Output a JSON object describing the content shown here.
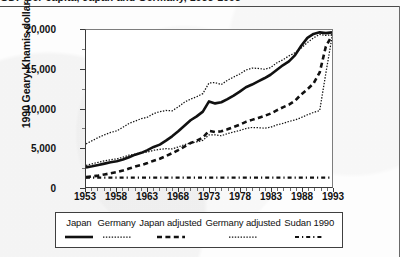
{
  "page": {
    "clipped_top_text": "GDP per capita, Japan and Germany, 1953-1993",
    "background_color": "#fdfdfd",
    "ink_color": "#111111"
  },
  "chart_data": {
    "type": "line",
    "title": "",
    "xlabel": "",
    "ylabel": "1990 Geary-Khamis dollars",
    "xlim": [
      1953,
      1993
    ],
    "ylim": [
      0,
      20000
    ],
    "ytick_values": [
      0,
      5000,
      10000,
      15000,
      20000
    ],
    "ytick_labels": [
      "0",
      "5,000",
      "10,000",
      "15,000",
      "20,000"
    ],
    "xtick_values": [
      1953,
      1958,
      1963,
      1968,
      1973,
      1978,
      1983,
      1988,
      1993
    ],
    "xtick_labels": [
      "1953",
      "1958",
      "1963",
      "1968",
      "1973",
      "1978",
      "1983",
      "1988",
      "1993"
    ],
    "minor_xticks_every": 1,
    "grid": false,
    "legend_position": "below-plot-boxed",
    "x": [
      1953,
      1954,
      1955,
      1956,
      1957,
      1958,
      1959,
      1960,
      1961,
      1962,
      1963,
      1964,
      1965,
      1966,
      1967,
      1968,
      1969,
      1970,
      1971,
      1972,
      1973,
      1974,
      1975,
      1976,
      1977,
      1978,
      1979,
      1980,
      1981,
      1982,
      1983,
      1984,
      1985,
      1986,
      1987,
      1988,
      1989,
      1990,
      1991,
      1992,
      1993
    ],
    "series": [
      {
        "name": "Japan",
        "style": "solid-thick",
        "color": "#111111",
        "values": [
          2500,
          2640,
          2800,
          2980,
          3150,
          3280,
          3500,
          3800,
          4120,
          4350,
          4700,
          5100,
          5400,
          5900,
          6450,
          7100,
          7800,
          8500,
          9000,
          9600,
          10900,
          10650,
          10800,
          11200,
          11650,
          12150,
          12700,
          13050,
          13450,
          13850,
          14300,
          14900,
          15500,
          16000,
          16800,
          18000,
          19000,
          19500,
          19700,
          19600,
          19700
        ]
      },
      {
        "name": "Germany",
        "style": "dotted-fine",
        "color": "#111111",
        "values": [
          5500,
          5900,
          6300,
          6650,
          6950,
          7150,
          7600,
          8100,
          8400,
          8700,
          8900,
          9350,
          9600,
          9750,
          9700,
          10200,
          10800,
          11200,
          11500,
          11900,
          13250,
          13300,
          13050,
          13600,
          14000,
          14400,
          14900,
          15150,
          15100,
          15000,
          15200,
          15800,
          16200,
          16700,
          17100,
          17700,
          18400,
          19000,
          19450,
          19300,
          19400
        ]
      },
      {
        "name": "Japan adjusted",
        "style": "dashed-thick",
        "color": "#111111",
        "values": [
          1250,
          1350,
          1450,
          1600,
          1750,
          1900,
          2100,
          2350,
          2600,
          2800,
          3050,
          3350,
          3600,
          3950,
          4300,
          4700,
          5150,
          5600,
          5900,
          6300,
          7150,
          7000,
          7100,
          7350,
          7650,
          7950,
          8300,
          8550,
          8800,
          9050,
          9350,
          9750,
          10150,
          10500,
          11000,
          11800,
          12450,
          13200,
          14600,
          17900,
          19300
        ]
      },
      {
        "name": "Germany adjusted",
        "style": "dotted-fine",
        "color": "#111111",
        "values": [
          2750,
          2950,
          3150,
          3330,
          3480,
          3580,
          3800,
          4050,
          4200,
          4350,
          4450,
          4680,
          4800,
          4880,
          4850,
          5100,
          5400,
          5600,
          5750,
          5950,
          6630,
          6650,
          6530,
          6800,
          7000,
          7200,
          7450,
          7580,
          7550,
          7500,
          7600,
          7900,
          8100,
          8350,
          8550,
          8850,
          9200,
          9500,
          9730,
          14500,
          19100
        ]
      },
      {
        "name": "Sudan 1990",
        "style": "dash-dot",
        "color": "#111111",
        "constant_value": 1200,
        "values": [
          1200,
          1200,
          1200,
          1200,
          1200,
          1200,
          1200,
          1200,
          1200,
          1200,
          1200,
          1200,
          1200,
          1200,
          1200,
          1200,
          1200,
          1200,
          1200,
          1200,
          1200,
          1200,
          1200,
          1200,
          1200,
          1200,
          1200,
          1200,
          1200,
          1200,
          1200,
          1200,
          1200,
          1200,
          1200,
          1200,
          1200,
          1200,
          1200,
          1200,
          1200
        ]
      }
    ]
  },
  "legend": {
    "items": [
      {
        "label": "Japan",
        "style": "solid-thick"
      },
      {
        "label": "Germany",
        "style": "dotted-fine"
      },
      {
        "label": "Japan adjusted",
        "style": "dashed-thick"
      },
      {
        "label": "Germany adjusted",
        "style": "dotted-fine"
      },
      {
        "label": "Sudan 1990",
        "style": "dash-dot"
      }
    ]
  }
}
